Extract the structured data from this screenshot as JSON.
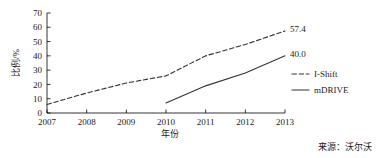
{
  "chart_data": {
    "type": "line",
    "title": "",
    "subtitle": "",
    "xlabel": "年份",
    "ylabel": "比例/%",
    "x": [
      2007,
      2008,
      2009,
      2010,
      2011,
      2012,
      2013
    ],
    "categories": [
      "2007",
      "2008",
      "2009",
      "2010",
      "2011",
      "2012",
      "2013"
    ],
    "xlim": [
      2007,
      2013
    ],
    "ylim": [
      0,
      70
    ],
    "yticks": [
      0,
      10,
      20,
      30,
      40,
      50,
      60,
      70
    ],
    "ytick_labels": [
      "0",
      "10",
      "20",
      "30",
      "40",
      "50",
      "60",
      "70"
    ],
    "xticks": [
      2007,
      2008,
      2009,
      2010,
      2011,
      2012,
      2013
    ],
    "xtick_labels": [
      "2007",
      "2008",
      "2009",
      "2010",
      "2011",
      "2012",
      "2013"
    ],
    "grid": false,
    "legend_position": "right",
    "series": [
      {
        "name": "I-Shift",
        "style": "dashed",
        "color": "#333333",
        "x": [
          2007,
          2008,
          2009,
          2010,
          2011,
          2012,
          2013
        ],
        "values": [
          6,
          14,
          21,
          26,
          40,
          48,
          57.4
        ],
        "end_label": "57.4"
      },
      {
        "name": "mDRIVE",
        "style": "solid",
        "color": "#333333",
        "x": [
          2010,
          2011,
          2012,
          2013
        ],
        "values": [
          7,
          19,
          28,
          40.0
        ],
        "end_label": "40.0"
      }
    ],
    "annotations": [
      {
        "text": "57.4",
        "series": "I-Shift",
        "x": 2013,
        "y": 57.4
      },
      {
        "text": "40.0",
        "series": "mDRIVE",
        "x": 2013,
        "y": 40.0
      }
    ]
  },
  "legend": {
    "items": [
      {
        "label": "I-Shift",
        "style": "dashed"
      },
      {
        "label": "mDRIVE",
        "style": "solid"
      }
    ]
  },
  "footer": {
    "source": "来源：沃尔沃"
  },
  "colors": {
    "axis": "#000000",
    "series": "#333333",
    "text": "#1a1a1a",
    "background": "#ffffff"
  }
}
